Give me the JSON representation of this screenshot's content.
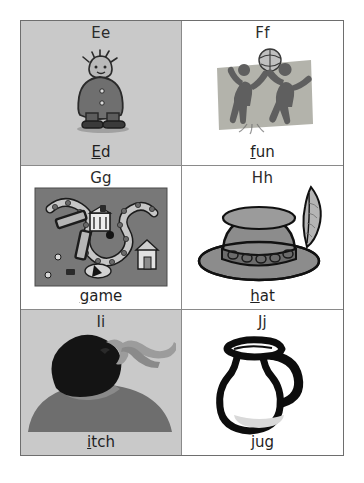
{
  "page": {
    "background_color": "#ffffff",
    "border_color": "#6e6e6e",
    "divider_color": "#8a8a8a",
    "shaded_cell_color": "#c9c9c9"
  },
  "grid": {
    "columns": 2,
    "rows": 3,
    "cells": [
      {
        "letter": "Ee",
        "word": "Ed",
        "word_underlined": "E",
        "word_rest": "d",
        "icon": "boy-character-illustration",
        "shaded": true,
        "art_colors": {
          "body": "#6f6f6f",
          "outline": "#2a2a2a",
          "face": "#b9b9b9",
          "shadow": "#9a9a9a"
        }
      },
      {
        "letter": "Ff",
        "word": "fun",
        "word_underlined": "f",
        "word_rest": "un",
        "icon": "children-playing-ball-illustration",
        "shaded": false,
        "art_colors": {
          "backdrop": "#b3b3ab",
          "figures": "#5f5f5f",
          "ball": "#c0c0c0",
          "outline": "#3a3a3a"
        }
      },
      {
        "letter": "Gg",
        "word": "game",
        "word_underlined": "g",
        "word_rest": "ame",
        "icon": "board-game-illustration",
        "shaded": false,
        "art_colors": {
          "board": "#787878",
          "path": "#c6c6c6",
          "outline": "#1c1c1c",
          "pieces": "#e2e2e2"
        }
      },
      {
        "letter": "Hh",
        "word": "hat",
        "word_underlined": "h",
        "word_rest": "at",
        "icon": "hat-with-feather-illustration",
        "shaded": false,
        "art_colors": {
          "hat": "#8c8c8c",
          "band": "#6b6b6b",
          "feather": "#b5b5b5",
          "outline": "#111111"
        }
      },
      {
        "letter": "Ii",
        "word": "itch",
        "word_underlined": "i",
        "word_rest": "tch",
        "icon": "person-scratching-head-silhouette",
        "shaded": true,
        "art_colors": {
          "hair": "#141414",
          "body": "#6e6e6e",
          "skin": "#9c9c9c",
          "outline": "#2a2a2a"
        }
      },
      {
        "letter": "Jj",
        "word": "jug",
        "word_underlined": "j",
        "word_rest": "ug",
        "icon": "jug-pitcher-illustration",
        "shaded": false,
        "art_colors": {
          "outline": "#0d0d0d",
          "fill": "#ffffff",
          "water": "#d9d9d9"
        }
      }
    ]
  }
}
